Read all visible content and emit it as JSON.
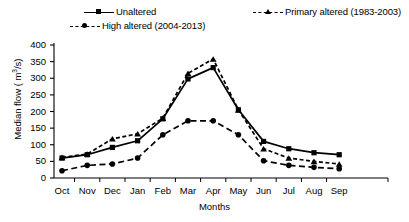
{
  "legend": {
    "position": "top",
    "items": [
      {
        "label": "Unaltered",
        "style": "solid",
        "marker": "square"
      },
      {
        "label": "Primary altered (1983-2003)",
        "style": "dashed",
        "marker": "triangle"
      },
      {
        "label": "High altered (2004-2013)",
        "style": "dashed-long",
        "marker": "circle"
      }
    ]
  },
  "axes": {
    "ylabel_main": "Median flow ( m",
    "ylabel_sup": "3",
    "ylabel_tail": "/s)",
    "xlabel": "Months"
  },
  "chart_data": {
    "type": "line",
    "title": "",
    "xlabel": "Months",
    "ylabel": "Median flow ( m3/s)",
    "categories": [
      "Oct",
      "Nov",
      "Dec",
      "Jan",
      "Feb",
      "Mar",
      "Apr",
      "May",
      "Jun",
      "Jul",
      "Aug",
      "Sep"
    ],
    "ylim": [
      0,
      400
    ],
    "yticks": [
      0,
      50,
      100,
      150,
      200,
      250,
      300,
      350,
      400
    ],
    "grid": false,
    "legend_position": "top",
    "series": [
      {
        "name": "Unaltered",
        "marker": "square",
        "line_style": "solid",
        "color": "#000000",
        "values": [
          60,
          70,
          92,
          112,
          178,
          298,
          332,
          205,
          110,
          88,
          76,
          70
        ]
      },
      {
        "name": "Primary altered (1983-2003)",
        "marker": "triangle",
        "line_style": "dashed",
        "color": "#000000",
        "values": [
          62,
          72,
          118,
          133,
          180,
          315,
          358,
          205,
          88,
          60,
          50,
          42
        ]
      },
      {
        "name": "High altered (2004-2013)",
        "marker": "circle",
        "line_style": "dashed-long",
        "color": "#000000",
        "values": [
          22,
          38,
          42,
          60,
          130,
          172,
          172,
          130,
          52,
          38,
          32,
          28
        ]
      }
    ]
  }
}
